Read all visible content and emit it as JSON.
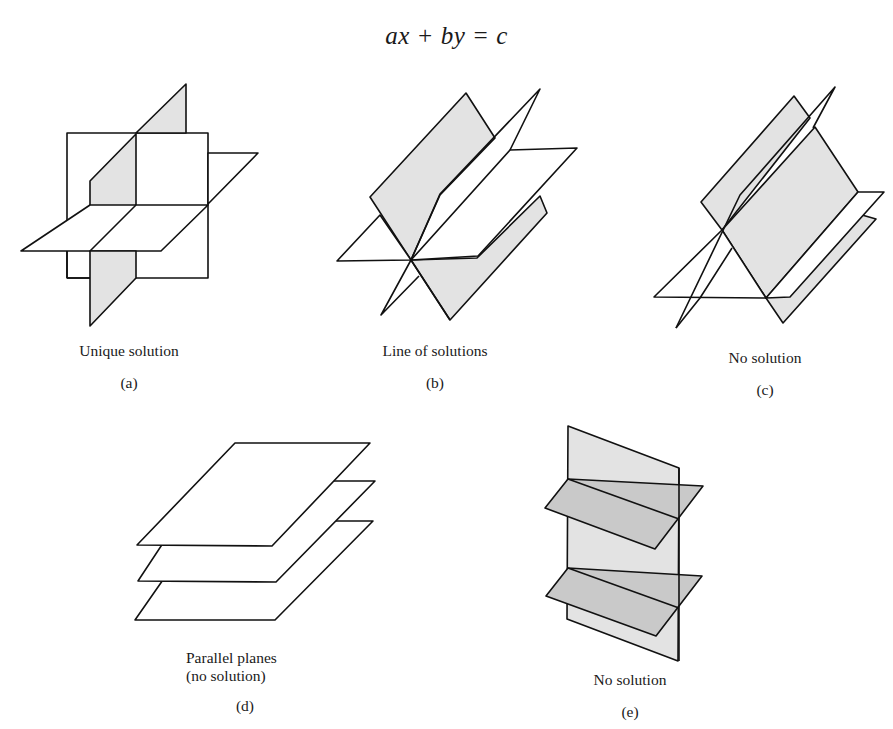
{
  "title": {
    "equation": "ax + by = c"
  },
  "panels": [
    {
      "id": "a",
      "caption": "Unique solution",
      "sublabel": "(a)"
    },
    {
      "id": "b",
      "caption": "Line of solutions",
      "sublabel": "(b)"
    },
    {
      "id": "c",
      "caption": "No solution",
      "sublabel": "(c)"
    },
    {
      "id": "d",
      "caption_line1": "Parallel planes",
      "caption_line2": "(no solution)",
      "sublabel": "(d)"
    },
    {
      "id": "e",
      "caption": "No solution",
      "sublabel": "(e)"
    }
  ],
  "colors": {
    "plane_light": "#e3e3e3",
    "plane_dark": "#c9c9c9",
    "outline": "#111111",
    "background": "#ffffff"
  }
}
